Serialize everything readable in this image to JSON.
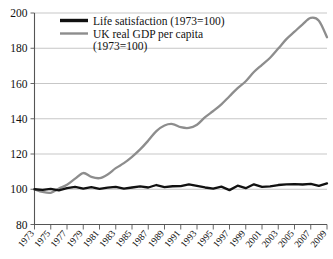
{
  "chart_data": {
    "type": "line",
    "title": "",
    "subtitle": "",
    "xlabel": "",
    "ylabel": "",
    "ylim": [
      80,
      200
    ],
    "xlim": [
      1973,
      2009
    ],
    "ytick_labels": [
      "200",
      "180",
      "160",
      "140",
      "120",
      "100",
      "80"
    ],
    "ytick_values": [
      200,
      180,
      160,
      140,
      120,
      100,
      80
    ],
    "grid": true,
    "legend_position": "top-left",
    "x": [
      1973,
      1974,
      1975,
      1976,
      1977,
      1978,
      1979,
      1980,
      1981,
      1982,
      1983,
      1984,
      1985,
      1986,
      1987,
      1988,
      1989,
      1990,
      1991,
      1992,
      1993,
      1994,
      1995,
      1996,
      1997,
      1998,
      1999,
      2000,
      2001,
      2002,
      2003,
      2004,
      2005,
      2006,
      2007,
      2008,
      2009
    ],
    "xtick_labels": [
      "1973",
      "1975",
      "1977",
      "1979",
      "1981",
      "1983",
      "1985",
      "1987",
      "1989",
      "1991",
      "1993",
      "1995",
      "1997",
      "1999",
      "2001",
      "2003",
      "2005",
      "2007",
      "2009"
    ],
    "xtick_values": [
      1973,
      1975,
      1977,
      1979,
      1981,
      1983,
      1985,
      1987,
      1989,
      1991,
      1993,
      1995,
      1997,
      1999,
      2001,
      2003,
      2005,
      2007,
      2009
    ],
    "series": [
      {
        "name": "Life satisfaction (1973=100)",
        "color": "#111111",
        "values": [
          100,
          99.6,
          100.2,
          99.4,
          100.6,
          101.4,
          100.3,
          101.2,
          100.2,
          100.9,
          101.4,
          100.4,
          101.0,
          101.6,
          101.0,
          102.4,
          101.2,
          101.7,
          101.8,
          102.8,
          101.9,
          101.0,
          100.3,
          101.5,
          99.5,
          102.0,
          100.6,
          102.8,
          101.3,
          101.6,
          102.4,
          102.8,
          102.9,
          102.7,
          103.0,
          101.9,
          103.3
        ]
      },
      {
        "name": "UK real GDP per capita (1973=100)",
        "color": "#8d8d8d",
        "values": [
          100,
          98.5,
          98.0,
          100.4,
          102.5,
          106.0,
          109.2,
          107.0,
          106.3,
          108.4,
          112.0,
          114.8,
          118.4,
          122.6,
          127.6,
          133.0,
          136.2,
          137.0,
          135.2,
          134.8,
          136.6,
          140.9,
          144.4,
          148.2,
          152.8,
          157.4,
          161.3,
          166.5,
          170.6,
          174.6,
          179.8,
          185.2,
          189.4,
          193.6,
          197.2,
          195.6,
          186.2
        ]
      }
    ],
    "legend": [
      {
        "label_line1": "Life satisfaction (1973=100)",
        "label_line2": "",
        "color": "#111111"
      },
      {
        "label_line1": "UK real GDP per capita",
        "label_line2": "(1973=100)",
        "color": "#8d8d8d"
      }
    ]
  }
}
